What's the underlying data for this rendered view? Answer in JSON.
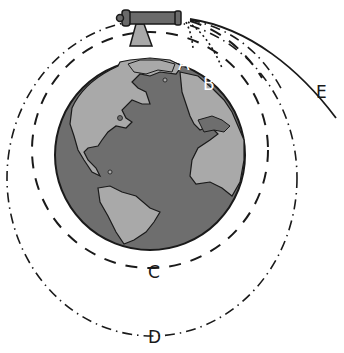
{
  "labels": {
    "A": "A",
    "B": "B",
    "C": "C",
    "D": "D",
    "E": "E"
  },
  "colors": {
    "ocean": "#6e6e6e",
    "land": "#a9a9a9",
    "outline": "#1a1a1a",
    "cannon": "#6a6a6a",
    "label_on_globe": "#ffffff",
    "label_outside": "#1a1a1a"
  },
  "trajectories": [
    {
      "id": "A",
      "style": "dotted",
      "description": "falls to ground near cannon"
    },
    {
      "id": "B",
      "style": "dotted",
      "description": "falls to ground farther away"
    },
    {
      "id": "C",
      "style": "dashed",
      "description": "circular orbit"
    },
    {
      "id": "D",
      "style": "dash-dot",
      "description": "elliptical orbit"
    },
    {
      "id": "E",
      "style": "solid",
      "description": "escape trajectory"
    }
  ]
}
